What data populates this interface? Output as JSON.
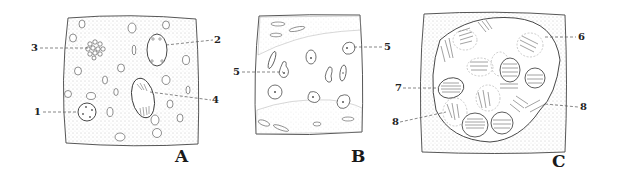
{
  "figure": {
    "colors": {
      "ink": "#3a3a3a",
      "stipple": "#9a9a9a",
      "background": "#ffffff"
    },
    "panels": [
      {
        "id": "A",
        "letter": "A",
        "callouts": [
          {
            "number": "3",
            "side": "left"
          },
          {
            "number": "2",
            "side": "right"
          },
          {
            "number": "1",
            "side": "left"
          },
          {
            "number": "4",
            "side": "right"
          }
        ]
      },
      {
        "id": "B",
        "letter": "B",
        "callouts": [
          {
            "number": "5",
            "side": "left"
          },
          {
            "number": "5",
            "side": "right"
          }
        ]
      },
      {
        "id": "C",
        "letter": "C",
        "callouts": [
          {
            "number": "6",
            "side": "right"
          },
          {
            "number": "7",
            "side": "left"
          },
          {
            "number": "8",
            "side": "left"
          },
          {
            "number": "8",
            "side": "right"
          }
        ]
      }
    ]
  }
}
